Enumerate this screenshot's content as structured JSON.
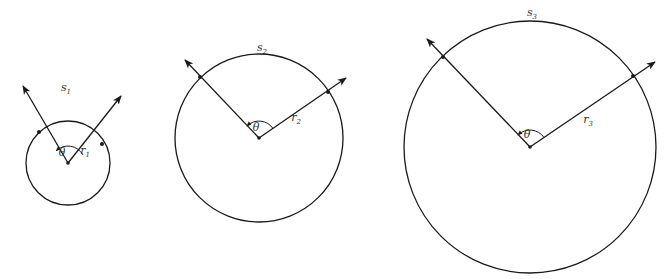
{
  "figure": {
    "stroke_color": "#1a1a1a",
    "label_color": "#333333",
    "circles": [
      {
        "id": 1,
        "arc_label": "s",
        "arc_sub": "1",
        "radius_label": "r",
        "radius_sub": "1",
        "angle_label": "θ",
        "cx": 68,
        "cy": 163,
        "r": 42,
        "p_left": [
          39,
          132
        ],
        "tip_left": [
          23,
          86
        ],
        "p_right": [
          102,
          144
        ],
        "tip_right": [
          121,
          96
        ],
        "arc_label_pos": [
          66,
          91
        ],
        "theta_pos": [
          62,
          156
        ],
        "r_label_pos": [
          85,
          154
        ]
      },
      {
        "id": 2,
        "arc_label": "s",
        "arc_sub": "2",
        "radius_label": "r",
        "radius_sub": "2",
        "angle_label": "θ",
        "cx": 259,
        "cy": 138,
        "r": 84,
        "p_left": [
          200,
          77
        ],
        "tip_left": [
          185,
          60
        ],
        "p_right": [
          328,
          92
        ],
        "tip_right": [
          346,
          78
        ],
        "arc_label_pos": [
          262,
          51
        ],
        "theta_pos": [
          256,
          131
        ],
        "r_label_pos": [
          296,
          121
        ]
      },
      {
        "id": 3,
        "arc_label": "s",
        "arc_sub": "3",
        "radius_label": "r",
        "radius_sub": "3",
        "angle_label": "θ",
        "cx": 530,
        "cy": 147,
        "r": 126,
        "p_left": [
          443,
          57
        ],
        "tip_left": [
          427,
          39
        ],
        "p_right": [
          633,
          76
        ],
        "tip_right": [
          655,
          62
        ],
        "arc_label_pos": [
          532,
          16
        ],
        "theta_pos": [
          527,
          138
        ],
        "r_label_pos": [
          588,
          123
        ]
      }
    ]
  }
}
